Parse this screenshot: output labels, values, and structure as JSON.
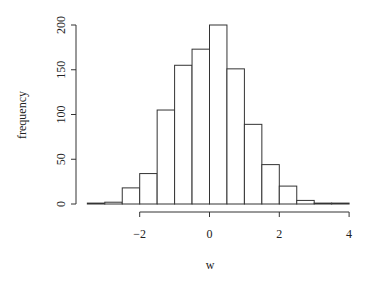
{
  "chart_data": {
    "type": "bar",
    "subtype": "histogram",
    "title": "",
    "xlabel": "w",
    "ylabel": "frequency",
    "bin_edges": [
      -3.5,
      -3.0,
      -2.5,
      -2.0,
      -1.5,
      -1.0,
      -0.5,
      0.0,
      0.5,
      1.0,
      1.5,
      2.0,
      2.5,
      3.0,
      3.5,
      4.0
    ],
    "values": [
      1,
      2,
      18,
      34,
      105,
      155,
      173,
      200,
      151,
      89,
      44,
      20,
      4,
      1,
      1
    ],
    "xlim": [
      -3.5,
      4.0
    ],
    "ylim": [
      0,
      200
    ],
    "xticks": [
      -2,
      0,
      2,
      4
    ],
    "xtick_labels": [
      "−2",
      "0",
      "2",
      "4"
    ],
    "yticks": [
      0,
      50,
      100,
      150,
      200
    ],
    "ytick_labels": [
      "0",
      "50",
      "100",
      "150",
      "200"
    ],
    "grid": false,
    "legend": null,
    "bar_fill": "#ffffff",
    "bar_stroke": "#333333"
  }
}
